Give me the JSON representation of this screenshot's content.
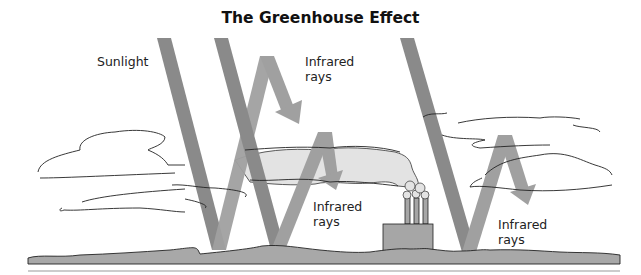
{
  "title": "The Greenhouse Effect",
  "labels": {
    "sunlight": "Sunlight",
    "infrared_top": [
      "Infrared",
      "rays"
    ],
    "infrared_middle": [
      "Infrared",
      "rays"
    ],
    "infrared_right": [
      "Infrared",
      "rays"
    ]
  },
  "colors": {
    "sunlight_beam": "#8c8c8c",
    "infrared_beam": "#9e9e9e",
    "ground": "#a8a8a8",
    "smog": "#e2e2e2",
    "factory": "#a6a6a6",
    "outline": "#222222"
  }
}
